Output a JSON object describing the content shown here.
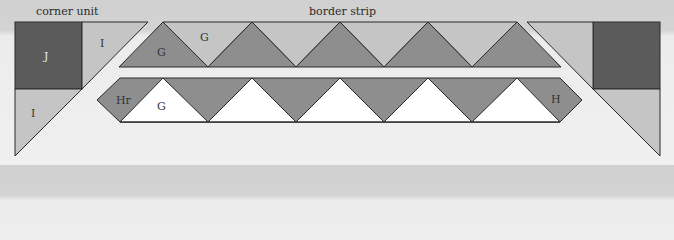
{
  "headings": {
    "corner_unit": "corner unit",
    "border_strip": "border strip"
  },
  "colors": {
    "dark": "#5b5b5b",
    "medium": "#8e8e8e",
    "light": "#c5c5c5",
    "white": "#ffffff",
    "outline": "#2a2a2a"
  },
  "left_corner": {
    "square_label": "J",
    "top_triangle_label": "I",
    "bottom_triangle_label": "I"
  },
  "top_strip": {
    "dark_triangle_label": "G",
    "light_triangle_label": "G",
    "dark_triangle_count": 5,
    "light_triangle_count": 4
  },
  "bottom_strip": {
    "left_end_label": "Hr",
    "white_triangle_label": "G",
    "right_end_label": "H",
    "white_triangle_count": 5
  },
  "right_corner": {
    "square_label": "",
    "top_triangle_label": "",
    "bottom_triangle_label": ""
  }
}
